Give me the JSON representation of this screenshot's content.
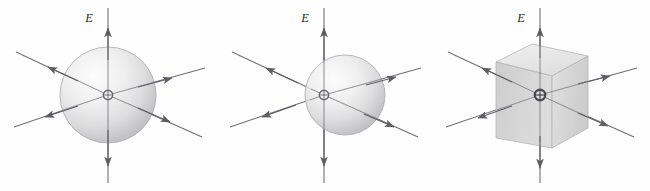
{
  "figure": {
    "background_color": "#fefefe",
    "panel_count": 3
  },
  "common": {
    "field_label": "E",
    "field_label_name": "electric-field-label",
    "charge_sign": "+",
    "charge_symbol_name": "point-charge-symbol",
    "line_color": "#6f6f78",
    "arrow_color": "#5d5d66",
    "surface_stroke": "#9a9a9a",
    "field_line_count": 6,
    "field_line_directions": [
      "up",
      "down",
      "upper-left",
      "upper-right",
      "lower-left",
      "lower-right"
    ]
  },
  "panels": [
    {
      "id": "panel-a",
      "name": "spherical-gaussian-surface-centered",
      "surface_type": "sphere",
      "surface_label": "sphere",
      "field_label": "E",
      "charge_sign": "+",
      "charge_position": "center",
      "radius_px": 48,
      "center_x": 108,
      "center_y": 95,
      "sphere_offset_x": 0,
      "highlight_color": "#f7f7f7",
      "shade_color": "#b9b9bd"
    },
    {
      "id": "panel-b",
      "name": "spherical-gaussian-surface-offset",
      "surface_type": "sphere",
      "surface_label": "sphere",
      "field_label": "E",
      "charge_sign": "+",
      "charge_position": "off-center-left",
      "radius_px": 40,
      "center_x": 108,
      "center_y": 95,
      "sphere_offset_x": 21,
      "highlight_color": "#f7f7f7",
      "shade_color": "#b9b9bd"
    },
    {
      "id": "panel-c",
      "name": "cubical-gaussian-surface",
      "surface_type": "cube",
      "surface_label": "cube",
      "field_label": "E",
      "charge_sign": "+",
      "charge_position": "center",
      "half_size_px": 44,
      "center_x": 108,
      "center_y": 95,
      "top_face_color": "#e8e8e8",
      "front_face_color": "#c9c9c9",
      "side_face_color": "#d6d6d6"
    }
  ]
}
